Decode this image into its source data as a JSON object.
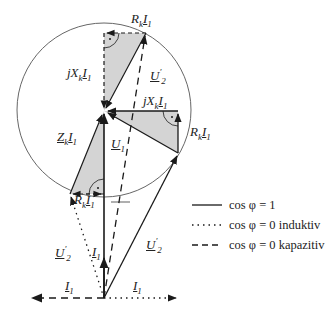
{
  "diagram": {
    "type": "phasor-diagram",
    "labels": {
      "rk_i1_top": "R",
      "jxk_i1_top": "jX",
      "u2p_top": "U",
      "jxk_i1_right": "jX",
      "rk_i1_right": "R",
      "zk_i1": "Z",
      "u1": "U",
      "rk_i1_bottom": "R",
      "u2p_left": "U",
      "i1_mid": "I",
      "u2p_right": "U",
      "i1_left": "I",
      "i1_right": "I"
    },
    "subscripts": {
      "k": "k",
      "one": "1",
      "two": "2",
      "prime": "′"
    }
  },
  "legend": {
    "items": [
      {
        "style": "solid",
        "label": "cos φ = 1"
      },
      {
        "style": "dotted",
        "label": "cos φ = 0 induktiv"
      },
      {
        "style": "dashed",
        "label": "cos φ = 0 kapazitiv"
      }
    ]
  },
  "colors": {
    "line": "#1a1a1a",
    "fill": "#d4d4d4",
    "circle": "#555555"
  }
}
